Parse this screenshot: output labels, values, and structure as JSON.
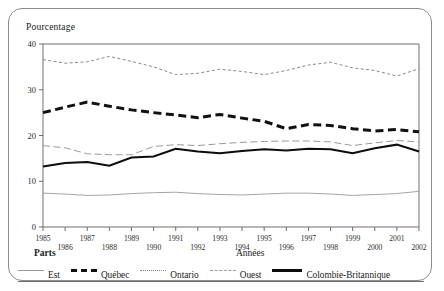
{
  "axis": {
    "ylabel": "Pourcentage",
    "xlabel": "Années",
    "yticks": [
      "0",
      "10",
      "20",
      "30",
      "40"
    ],
    "xticks_top": [
      "1985",
      "1987",
      "1989",
      "1991",
      "1993",
      "1995",
      "1997",
      "1999",
      "2001"
    ],
    "xticks_bottom": [
      "1986",
      "1988",
      "1990",
      "1992",
      "1994",
      "1996",
      "1998",
      "2000",
      "2002"
    ]
  },
  "legend": {
    "title": "Parts",
    "items": [
      {
        "label": "Est",
        "style": "thin-solid",
        "color": "#9a9a9a"
      },
      {
        "label": "Québec",
        "style": "thick-dashed",
        "color": "#111111"
      },
      {
        "label": "Ontario",
        "style": "dotted",
        "color": "#8a8a8a"
      },
      {
        "label": "Ouest",
        "style": "long-dashed",
        "color": "#9a9a9a"
      },
      {
        "label": "Colombie-Britannique",
        "style": "thick-solid",
        "color": "#0d0d0d"
      }
    ]
  },
  "chart_data": {
    "type": "line",
    "title": "",
    "xlabel": "Années",
    "ylabel": "Pourcentage",
    "xlim": [
      1985,
      2002
    ],
    "ylim": [
      0,
      40
    ],
    "grid": false,
    "legend_position": "bottom",
    "x": [
      1985,
      1986,
      1987,
      1988,
      1989,
      1990,
      1991,
      1992,
      1993,
      1994,
      1995,
      1996,
      1997,
      1998,
      1999,
      2000,
      2001,
      2002
    ],
    "series": [
      {
        "name": "Est",
        "values": [
          7.4,
          7.2,
          6.9,
          7.0,
          7.3,
          7.5,
          7.6,
          7.3,
          7.1,
          7.0,
          7.2,
          7.4,
          7.4,
          7.2,
          6.9,
          7.1,
          7.3,
          7.8
        ]
      },
      {
        "name": "Québec",
        "values": [
          25.0,
          26.2,
          27.3,
          26.4,
          25.6,
          25.0,
          24.5,
          23.9,
          24.6,
          23.8,
          23.1,
          21.5,
          22.4,
          22.2,
          21.5,
          21.0,
          21.3,
          20.8
        ]
      },
      {
        "name": "Ontario",
        "values": [
          36.6,
          35.8,
          36.1,
          37.3,
          36.2,
          35.0,
          33.3,
          33.6,
          34.5,
          34.0,
          33.3,
          34.2,
          35.4,
          36.0,
          34.8,
          34.2,
          33.0,
          34.6
        ]
      },
      {
        "name": "Ouest",
        "values": [
          17.8,
          17.3,
          16.0,
          15.8,
          15.8,
          17.6,
          18.0,
          17.8,
          18.2,
          18.5,
          18.7,
          18.8,
          18.8,
          18.6,
          17.8,
          18.4,
          18.9,
          18.6
        ]
      },
      {
        "name": "Colombie-Britannique",
        "values": [
          13.2,
          14.0,
          14.2,
          13.4,
          15.2,
          15.4,
          17.1,
          16.5,
          16.1,
          16.6,
          17.0,
          16.7,
          17.1,
          17.0,
          16.1,
          17.2,
          18.0,
          16.5
        ]
      }
    ]
  }
}
